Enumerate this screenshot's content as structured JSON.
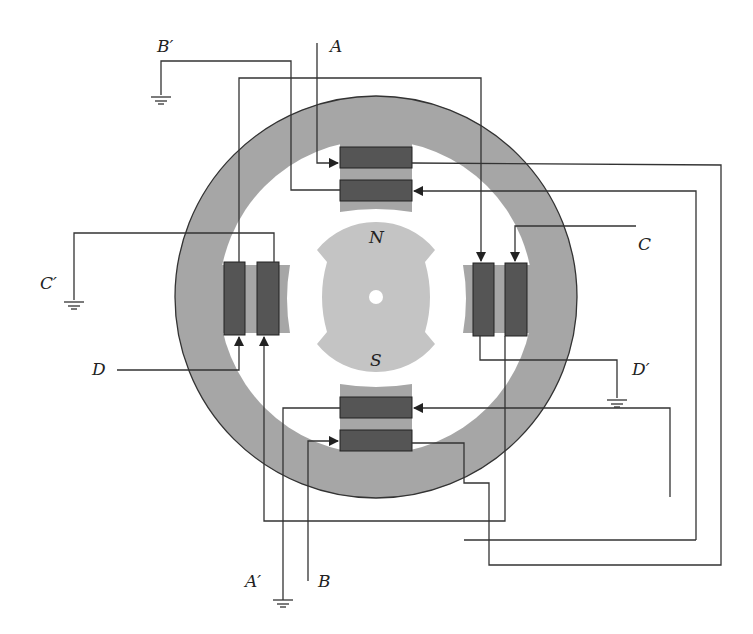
{
  "figure": {
    "colors": {
      "stator": "#a6a6a6",
      "rotor": "#c4c4c4",
      "coil": "#555555",
      "wire": "#333333",
      "background": "#ffffff"
    }
  },
  "labels": {
    "terminal_A": "A",
    "terminal_A_prime": "A′",
    "terminal_B": "B",
    "terminal_B_prime": "B′",
    "terminal_C": "C",
    "terminal_C_prime": "C′",
    "terminal_D": "D",
    "terminal_D_prime": "D′",
    "rotor_north": "N",
    "rotor_south": "S"
  },
  "poles": [
    {
      "position": "top",
      "coils": [
        "A",
        "B′"
      ]
    },
    {
      "position": "right",
      "coils": [
        "D′",
        "C"
      ]
    },
    {
      "position": "bottom",
      "coils": [
        "A′",
        "B"
      ]
    },
    {
      "position": "left",
      "coils": [
        "C′",
        "D"
      ]
    }
  ],
  "grounds": [
    "B′",
    "C′",
    "D′",
    "A′"
  ]
}
